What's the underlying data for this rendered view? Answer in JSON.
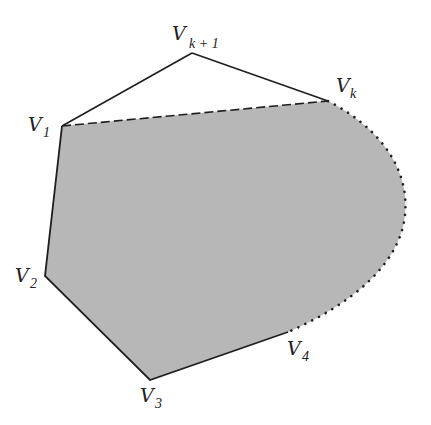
{
  "diagram": {
    "colors": {
      "fill": "#b7b7b7",
      "stroke": "#1e1e1e",
      "background": "#ffffff"
    },
    "vertices": [
      {
        "id": "V1",
        "base": "V",
        "sub": "1",
        "x": 62,
        "y": 126
      },
      {
        "id": "V2",
        "base": "V",
        "sub": "2",
        "x": 45,
        "y": 276
      },
      {
        "id": "V3",
        "base": "V",
        "sub": "3",
        "x": 150,
        "y": 380
      },
      {
        "id": "V4",
        "base": "V",
        "sub": "4",
        "x": 288,
        "y": 332
      },
      {
        "id": "Vk",
        "base": "V",
        "sub": "k",
        "x": 328,
        "y": 101
      },
      {
        "id": "Vk+1",
        "base": "V",
        "sub": "k + 1",
        "x": 192,
        "y": 53
      }
    ],
    "labels": {
      "v1": {
        "base": "V",
        "sub": "1"
      },
      "v2": {
        "base": "V",
        "sub": "2"
      },
      "v3": {
        "base": "V",
        "sub": "3"
      },
      "v4": {
        "base": "V",
        "sub": "4"
      },
      "vk": {
        "base": "V",
        "sub": "k"
      },
      "vk1": {
        "base": "V",
        "sub": "k + 1"
      }
    },
    "edges": [
      {
        "from": "V1",
        "to": "Vk+1",
        "style": "solid"
      },
      {
        "from": "Vk+1",
        "to": "Vk",
        "style": "solid"
      },
      {
        "from": "V1",
        "to": "Vk",
        "style": "dashed"
      },
      {
        "from": "V1",
        "to": "V2",
        "style": "solid"
      },
      {
        "from": "V2",
        "to": "V3",
        "style": "solid"
      },
      {
        "from": "V3",
        "to": "V4",
        "style": "solid"
      },
      {
        "from": "V4",
        "to": "Vk",
        "style": "dotted-arc"
      }
    ]
  }
}
